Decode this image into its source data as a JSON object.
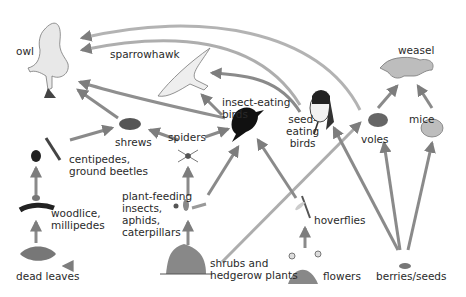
{
  "colors": {
    "arrow": "#8a8a8a",
    "arrow_light": "#c4c4c4",
    "text": "#2a2a2a",
    "organism_dark": "#1a1a1a",
    "organism_gray": "#a8a8a8"
  },
  "nodes": {
    "owl": {
      "label": "owl",
      "icon": "owl-icon"
    },
    "sparrowhawk": {
      "label": "sparrowhawk",
      "icon": "sparrowhawk-icon"
    },
    "insect_eating_birds": {
      "label": "insect-eating\nbirds",
      "icon": "blackbird-icon"
    },
    "seed_eating_birds": {
      "label": "seed-\neating\nbirds",
      "icon": "tit-bird-icon"
    },
    "weasel": {
      "label": "weasel",
      "icon": "weasel-icon"
    },
    "mice": {
      "label": "mice",
      "icon": "mouse-icon"
    },
    "voles": {
      "label": "voles",
      "icon": "vole-icon"
    },
    "shrews": {
      "label": "shrews",
      "icon": "shrew-icon"
    },
    "spiders": {
      "label": "spiders",
      "icon": "spider-icon"
    },
    "centipedes": {
      "label": "centipedes,\nground beetles",
      "icon": "centipede-beetle-icon"
    },
    "woodlice": {
      "label": "woodlice,\nmillipedes",
      "icon": "woodlouse-millipede-icon"
    },
    "plant_feeding_insects": {
      "label": "plant-feeding\ninsects,\naphids,\ncaterpillars",
      "icon": "aphid-caterpillar-icon"
    },
    "hoverflies": {
      "label": "hoverflies",
      "icon": "hoverfly-icon"
    },
    "dead_leaves": {
      "label": "dead leaves",
      "icon": "dead-leaves-icon"
    },
    "shrubs": {
      "label": "shrubs and\nhedgerow plants",
      "icon": "shrub-icon"
    },
    "flowers": {
      "label": "flowers",
      "icon": "flowers-icon"
    },
    "berries": {
      "label": "berries/seeds",
      "icon": "berries-icon"
    }
  },
  "edges": [
    [
      "shrubs",
      "dead_leaves"
    ],
    [
      "dead_leaves",
      "woodlice"
    ],
    [
      "woodlice",
      "centipedes"
    ],
    [
      "centipedes",
      "shrews"
    ],
    [
      "shrubs",
      "plant_feeding_insects"
    ],
    [
      "plant_feeding_insects",
      "spiders"
    ],
    [
      "plant_feeding_insects",
      "insect_eating_birds"
    ],
    [
      "spiders",
      "shrews"
    ],
    [
      "spiders",
      "insect_eating_birds"
    ],
    [
      "shrews",
      "owl"
    ],
    [
      "insect_eating_birds",
      "sparrowhawk"
    ],
    [
      "insect_eating_birds",
      "owl"
    ],
    [
      "seed_eating_birds",
      "sparrowhawk"
    ],
    [
      "seed_eating_birds",
      "owl"
    ],
    [
      "flowers",
      "hoverflies"
    ],
    [
      "hoverflies",
      "insect_eating_birds"
    ],
    [
      "shrubs",
      "voles"
    ],
    [
      "berries",
      "seed_eating_birds"
    ],
    [
      "berries",
      "voles"
    ],
    [
      "berries",
      "mice"
    ],
    [
      "voles",
      "weasel"
    ],
    [
      "mice",
      "weasel"
    ],
    [
      "voles",
      "owl"
    ]
  ]
}
